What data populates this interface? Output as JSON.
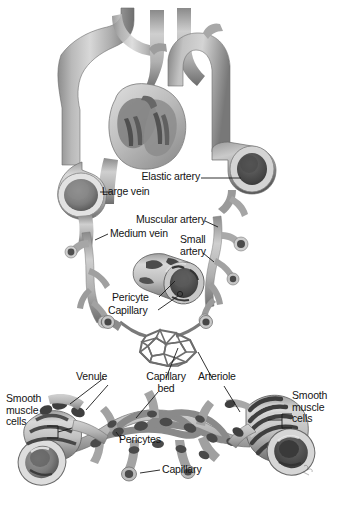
{
  "figure": {
    "background_color": "#ffffff",
    "ink_color": "#141414",
    "vessel_color_light": "#c9c9c9",
    "vessel_color_mid": "#9a9a9a",
    "vessel_color_dark": "#5e5e5e",
    "vessel_color_darkest": "#3a3a3a"
  },
  "labels": {
    "elastic_artery": "Elastic artery",
    "large_vein": "Large vein",
    "muscular_artery": "Muscular artery",
    "medium_vein": "Medium vein",
    "small_artery": "Small\nartery",
    "pericyte": "Pericyte",
    "capillary_top": "Capillary",
    "venule": "Venule",
    "capillary_bed": "Capillary\nbed",
    "arteriole": "Arteriole",
    "smooth_muscle_left": "Smooth\nmuscle\ncells",
    "smooth_muscle_right": "Smooth\nmuscle\ncells",
    "pericytes": "Pericytes",
    "capillary_bottom": "Capillary"
  },
  "structures": {
    "heart": "heart-cross-section",
    "aortic_arch": "aortic-arch",
    "brachiocephalic_branches": "great-vessel-branches",
    "superior_vena_cava": "large-vein-trunk",
    "elastic_artery_cut": "elastic-artery-cut-end",
    "large_vein_cut": "large-vein-cut-end",
    "muscular_artery_branch": "muscular-artery",
    "medium_vein_branch": "medium-vein",
    "small_artery_branch": "small-artery",
    "capillary_closeup": "capillary-with-pericyte-closeup",
    "capillary_network": "capillary-bed-mesh",
    "venule_vessel": "venule-cut-end",
    "arteriole_vessel": "arteriole-cut-end",
    "lower_capillary_bed": "lower-capillary-bed-network",
    "signature": "artist-signature"
  }
}
